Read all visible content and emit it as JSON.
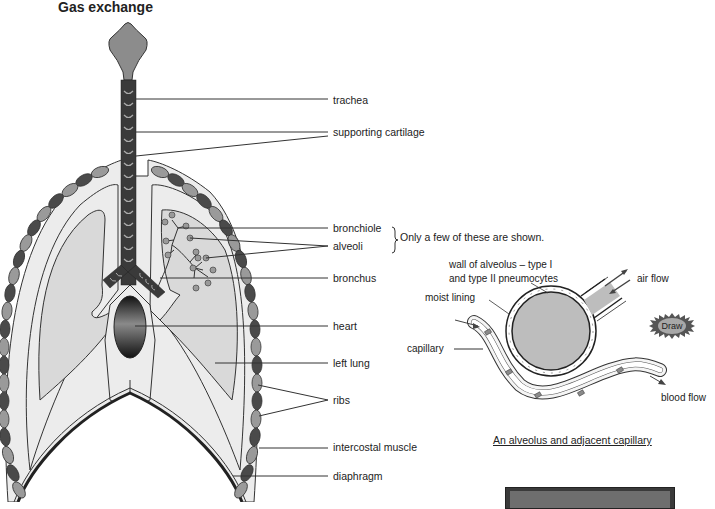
{
  "title": "Gas exchange",
  "lung_labels": [
    {
      "id": "trachea",
      "text": "trachea"
    },
    {
      "id": "supporting-cartilage",
      "text": "supporting cartilage"
    },
    {
      "id": "bronchiole",
      "text": "bronchiole"
    },
    {
      "id": "alveoli",
      "text": "alveoli"
    },
    {
      "id": "bronchus",
      "text": "bronchus"
    },
    {
      "id": "heart",
      "text": "heart"
    },
    {
      "id": "left-lung",
      "text": "left lung"
    },
    {
      "id": "ribs",
      "text": "ribs"
    },
    {
      "id": "intercostal-muscle",
      "text": "intercostal muscle"
    },
    {
      "id": "diaphragm",
      "text": "diaphragm"
    }
  ],
  "note": "Only a few of these are shown.",
  "alveolus_labels": {
    "wall_line1": "wall of alveolus – type I",
    "wall_line2": "and type II pneumocytes",
    "moist_lining": "moist lining",
    "capillary": "capillary",
    "air_flow": "air flow",
    "blood_flow": "blood flow"
  },
  "draw_button": "Draw",
  "caption": "An alveolus and adjacent capillary",
  "colors": {
    "trachea_dark": "#3a3a3a",
    "larynx": "#8c8c8c",
    "lung_fill": "#d9d9d9",
    "pleura_fill": "#ececec",
    "rib_dark": "#4a4a4a",
    "rib_light": "#9a9a9a",
    "alveolus_fill": "#bdbdbd",
    "line": "#333333"
  }
}
